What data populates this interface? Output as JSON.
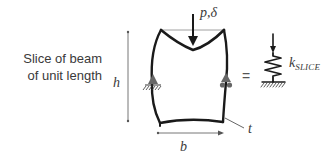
{
  "caption": {
    "line1": "Slice of beam",
    "line2": "of unit length"
  },
  "labels": {
    "height": "h",
    "width": "b",
    "thickness": "t",
    "load": "p,δ",
    "equals": "=",
    "stiffness_symbol": "k",
    "stiffness_subscript": "SLICE"
  },
  "colors": {
    "stroke": "#1a1a1a",
    "dimension": "#555555",
    "text": "#3a3a3a",
    "support_fill": "#666666"
  }
}
